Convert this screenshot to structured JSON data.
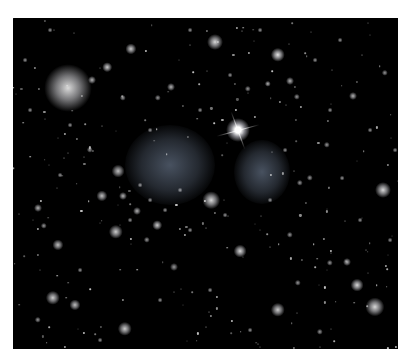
{
  "image": {
    "description": "Deep-field astronomical image of a galaxy cluster: black sky dotted with many small galaxies and stars, two diffuse bluish-gray glow regions near center, one bright star with diffraction spikes, and a large fuzzy elliptical galaxy upper-left.",
    "background_color": "#000000",
    "frame_color": "#ffffff"
  },
  "diffuse_regions": [
    {
      "x": 170,
      "y": 165,
      "rx": 45,
      "ry": 40,
      "color": "#5a6678"
    },
    {
      "x": 262,
      "y": 172,
      "rx": 28,
      "ry": 32,
      "color": "#5a6678"
    }
  ],
  "bright_star": {
    "x": 238,
    "y": 130,
    "size": 10
  },
  "objects": [
    {
      "x": 68,
      "y": 88,
      "s": 30,
      "b": 0.85
    },
    {
      "x": 131,
      "y": 49,
      "s": 7,
      "b": 0.8
    },
    {
      "x": 215,
      "y": 42,
      "s": 10,
      "b": 0.85
    },
    {
      "x": 278,
      "y": 55,
      "s": 9,
      "b": 0.9
    },
    {
      "x": 107,
      "y": 67,
      "s": 6,
      "b": 0.8
    },
    {
      "x": 92,
      "y": 80,
      "s": 5,
      "b": 0.7
    },
    {
      "x": 171,
      "y": 87,
      "s": 5,
      "b": 0.7
    },
    {
      "x": 158,
      "y": 98,
      "s": 4,
      "b": 0.6
    },
    {
      "x": 123,
      "y": 98,
      "s": 4,
      "b": 0.6
    },
    {
      "x": 290,
      "y": 81,
      "s": 5,
      "b": 0.7
    },
    {
      "x": 268,
      "y": 84,
      "s": 4,
      "b": 0.7
    },
    {
      "x": 248,
      "y": 89,
      "s": 4,
      "b": 0.6
    },
    {
      "x": 297,
      "y": 97,
      "s": 4,
      "b": 0.6
    },
    {
      "x": 353,
      "y": 96,
      "s": 5,
      "b": 0.7
    },
    {
      "x": 385,
      "y": 73,
      "s": 4,
      "b": 0.6
    },
    {
      "x": 383,
      "y": 190,
      "s": 10,
      "b": 0.85
    },
    {
      "x": 118,
      "y": 171,
      "s": 8,
      "b": 0.75
    },
    {
      "x": 102,
      "y": 196,
      "s": 7,
      "b": 0.75
    },
    {
      "x": 123,
      "y": 196,
      "s": 5,
      "b": 0.7
    },
    {
      "x": 137,
      "y": 211,
      "s": 5,
      "b": 0.7
    },
    {
      "x": 157,
      "y": 225,
      "s": 6,
      "b": 0.8
    },
    {
      "x": 211,
      "y": 200,
      "s": 11,
      "b": 0.85
    },
    {
      "x": 240,
      "y": 251,
      "s": 8,
      "b": 0.85
    },
    {
      "x": 58,
      "y": 245,
      "s": 7,
      "b": 0.75
    },
    {
      "x": 38,
      "y": 208,
      "s": 5,
      "b": 0.7
    },
    {
      "x": 44,
      "y": 226,
      "s": 4,
      "b": 0.6
    },
    {
      "x": 116,
      "y": 232,
      "s": 9,
      "b": 0.8
    },
    {
      "x": 147,
      "y": 240,
      "s": 4,
      "b": 0.6
    },
    {
      "x": 174,
      "y": 267,
      "s": 5,
      "b": 0.6
    },
    {
      "x": 53,
      "y": 298,
      "s": 9,
      "b": 0.8
    },
    {
      "x": 75,
      "y": 305,
      "s": 7,
      "b": 0.75
    },
    {
      "x": 125,
      "y": 329,
      "s": 9,
      "b": 0.8
    },
    {
      "x": 38,
      "y": 320,
      "s": 4,
      "b": 0.6
    },
    {
      "x": 278,
      "y": 310,
      "s": 9,
      "b": 0.8
    },
    {
      "x": 357,
      "y": 285,
      "s": 8,
      "b": 0.85
    },
    {
      "x": 375,
      "y": 307,
      "s": 12,
      "b": 0.85
    },
    {
      "x": 347,
      "y": 262,
      "s": 5,
      "b": 0.7
    },
    {
      "x": 330,
      "y": 263,
      "s": 4,
      "b": 0.6
    },
    {
      "x": 290,
      "y": 235,
      "s": 4,
      "b": 0.6
    },
    {
      "x": 298,
      "y": 283,
      "s": 4,
      "b": 0.6
    },
    {
      "x": 320,
      "y": 332,
      "s": 4,
      "b": 0.6
    },
    {
      "x": 300,
      "y": 183,
      "s": 4,
      "b": 0.6
    },
    {
      "x": 310,
      "y": 178,
      "s": 4,
      "b": 0.6
    },
    {
      "x": 327,
      "y": 145,
      "s": 4,
      "b": 0.6
    },
    {
      "x": 342,
      "y": 178,
      "s": 3,
      "b": 0.6
    },
    {
      "x": 210,
      "y": 352,
      "s": 4,
      "b": 0.6
    },
    {
      "x": 90,
      "y": 150,
      "s": 4,
      "b": 0.6
    },
    {
      "x": 60,
      "y": 175,
      "s": 3,
      "b": 0.6
    },
    {
      "x": 30,
      "y": 110,
      "s": 3,
      "b": 0.6
    },
    {
      "x": 25,
      "y": 60,
      "s": 3,
      "b": 0.6
    },
    {
      "x": 50,
      "y": 30,
      "s": 3,
      "b": 0.6
    },
    {
      "x": 190,
      "y": 30,
      "s": 3,
      "b": 0.6
    },
    {
      "x": 260,
      "y": 30,
      "s": 3,
      "b": 0.6
    },
    {
      "x": 340,
      "y": 40,
      "s": 3,
      "b": 0.6
    },
    {
      "x": 370,
      "y": 130,
      "s": 3,
      "b": 0.6
    },
    {
      "x": 390,
      "y": 240,
      "s": 3,
      "b": 0.6
    },
    {
      "x": 160,
      "y": 300,
      "s": 3,
      "b": 0.6
    },
    {
      "x": 210,
      "y": 290,
      "s": 3,
      "b": 0.6
    },
    {
      "x": 250,
      "y": 330,
      "s": 3,
      "b": 0.6
    },
    {
      "x": 100,
      "y": 340,
      "s": 3,
      "b": 0.6
    },
    {
      "x": 140,
      "y": 185,
      "s": 3,
      "b": 0.6
    },
    {
      "x": 150,
      "y": 200,
      "s": 3,
      "b": 0.6
    },
    {
      "x": 165,
      "y": 210,
      "s": 3,
      "b": 0.6
    },
    {
      "x": 180,
      "y": 190,
      "s": 3,
      "b": 0.6
    },
    {
      "x": 130,
      "y": 220,
      "s": 3,
      "b": 0.6
    },
    {
      "x": 190,
      "y": 230,
      "s": 3,
      "b": 0.6
    },
    {
      "x": 225,
      "y": 215,
      "s": 3,
      "b": 0.6
    },
    {
      "x": 270,
      "y": 200,
      "s": 3,
      "b": 0.6
    },
    {
      "x": 285,
      "y": 150,
      "s": 3,
      "b": 0.6
    },
    {
      "x": 230,
      "y": 75,
      "s": 3,
      "b": 0.6
    },
    {
      "x": 315,
      "y": 60,
      "s": 3,
      "b": 0.6
    },
    {
      "x": 360,
      "y": 220,
      "s": 3,
      "b": 0.6
    },
    {
      "x": 80,
      "y": 270,
      "s": 3,
      "b": 0.6
    },
    {
      "x": 70,
      "y": 125,
      "s": 3,
      "b": 0.6
    },
    {
      "x": 150,
      "y": 130,
      "s": 3,
      "b": 0.6
    },
    {
      "x": 200,
      "y": 110,
      "s": 3,
      "b": 0.6
    },
    {
      "x": 330,
      "y": 110,
      "s": 3,
      "b": 0.6
    },
    {
      "x": 395,
      "y": 150,
      "s": 3,
      "b": 0.6
    }
  ]
}
